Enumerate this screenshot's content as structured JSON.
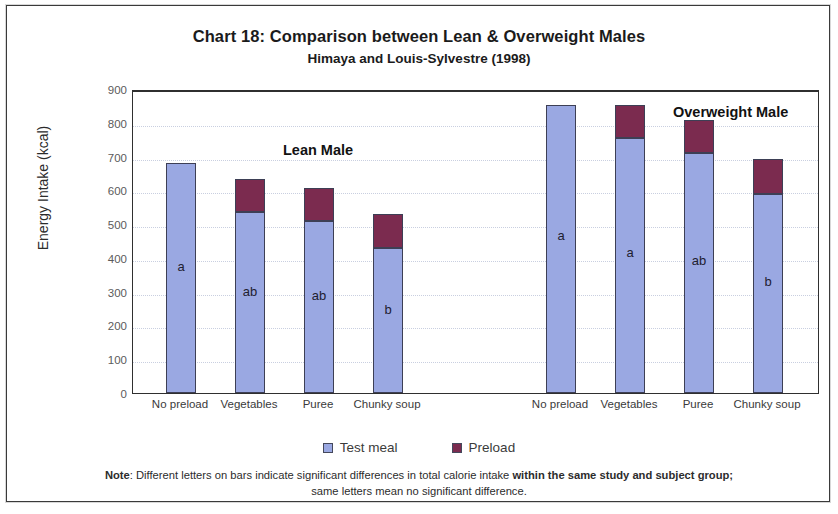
{
  "chart_data": {
    "type": "bar",
    "title": "Chart 18: Comparison between Lean & Overweight Males",
    "subtitle": "Himaya and Louis-Sylvestre (1998)",
    "xlabel": "",
    "ylabel": "Energy Intake (kcal)",
    "ylim": [
      0,
      900
    ],
    "ytick_step": 100,
    "yticks": [
      "900",
      "800",
      "700",
      "600",
      "500",
      "400",
      "300",
      "200",
      "100",
      "0"
    ],
    "grid": true,
    "stacked": true,
    "legend_position": "bottom-center",
    "categories": [
      "No preload",
      "Vegetables",
      "Puree",
      "Chunky soup",
      "No preload",
      "Vegetables",
      "Puree",
      "Chunky soup"
    ],
    "series": [
      {
        "name": "Test meal",
        "color": "#9aa8e2",
        "values": [
          680,
          535,
          510,
          430,
          853,
          755,
          710,
          590
        ]
      },
      {
        "name": "Preload",
        "color": "#7b2b4f",
        "values": [
          0,
          100,
          98,
          100,
          0,
          97,
          98,
          102
        ]
      }
    ],
    "totals": [
      680,
      635,
      608,
      530,
      853,
      852,
      808,
      692
    ],
    "bar_letters": [
      "a",
      "ab",
      "ab",
      "b",
      "a",
      "a",
      "ab",
      "b"
    ],
    "groups": [
      {
        "label": "Lean Male",
        "categories": [
          "No preload",
          "Vegetables",
          "Puree",
          "Chunky soup"
        ]
      },
      {
        "label": "Overweight Male",
        "categories": [
          "No preload",
          "Vegetables",
          "Puree",
          "Chunky soup"
        ]
      }
    ],
    "annotations": [
      {
        "text": "Lean Male",
        "group": 0
      },
      {
        "text": "Overweight Male",
        "group": 1
      }
    ]
  },
  "legend": {
    "items": [
      {
        "label": "Test meal",
        "color": "#9aa8e2"
      },
      {
        "label": "Preload",
        "color": "#7b2b4f"
      }
    ]
  },
  "note": {
    "prefix": "Note",
    "line1_a": ": Different letters on bars indicate significant differences in total calorie intake ",
    "line1_bold": "within the same study and subject group;",
    "line2": "same letters mean no significant difference."
  }
}
